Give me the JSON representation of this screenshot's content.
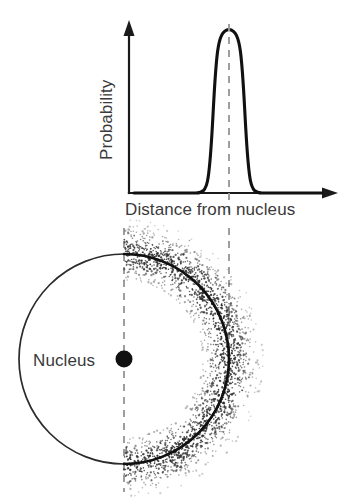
{
  "figure": {
    "background_color": "#ffffff",
    "ink_color": "#111111",
    "dash_color": "#9a9a9a",
    "label_color": "#3a3a3a"
  },
  "chart_data": {
    "type": "line",
    "title": "",
    "xlabel": "Distance from nucleus",
    "ylabel": "Probability",
    "grid": false,
    "legend": null,
    "axis_arrows": true,
    "tick_labels_x": [],
    "tick_labels_y": [],
    "xlim": [
      0,
      1
    ],
    "ylim": [
      0,
      1
    ],
    "series": [
      {
        "name": "Radial probability",
        "shape": "gaussian",
        "peak_x": 0.52,
        "peak_y": 1.0,
        "sigma": 0.055,
        "baseline_y": 0.0,
        "x": [
          0.0,
          0.05,
          0.1,
          0.15,
          0.2,
          0.25,
          0.3,
          0.34,
          0.38,
          0.41,
          0.44,
          0.46,
          0.48,
          0.5,
          0.52,
          0.54,
          0.56,
          0.58,
          0.6,
          0.63,
          0.66,
          0.7,
          0.75,
          0.8,
          0.85,
          0.9,
          1.0
        ],
        "values": [
          0.0,
          0.0,
          0.0,
          0.0,
          0.0,
          0.0,
          0.01,
          0.02,
          0.06,
          0.15,
          0.35,
          0.55,
          0.78,
          0.95,
          1.0,
          0.95,
          0.78,
          0.55,
          0.35,
          0.15,
          0.06,
          0.02,
          0.01,
          0.0,
          0.0,
          0.0,
          0.0
        ]
      }
    ],
    "annotations": [
      {
        "name": "peak-guide-line",
        "type": "vertical-dashed",
        "x": 0.52,
        "note": "Marks most probable distance; aligns with outer shell radius"
      },
      {
        "name": "nucleus-guide-line",
        "type": "vertical-dashed",
        "x": 0.0,
        "note": "Marks nucleus center position"
      }
    ]
  },
  "diagram": {
    "nucleus_label": "Nucleus",
    "shell_description": "Circular orbital shell with stippled electron probability cloud",
    "cloud_side": "right",
    "nucleus_center": {
      "x": 124,
      "y": 359
    },
    "shell_radius": 105
  },
  "labels": {
    "x_axis": "Distance from nucleus",
    "y_axis": "Probability",
    "nucleus": "Nucleus"
  }
}
